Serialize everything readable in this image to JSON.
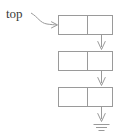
{
  "diagram": {
    "title": "top",
    "type": "linked-list-stack",
    "pointer_label": {
      "text": "top",
      "x": 6,
      "y": 16
    },
    "colors": {
      "stroke": "#9a9a9a",
      "box_fill": "#ffffff",
      "text": "#3a3a3a",
      "background": "#ffffff"
    },
    "geometry": {
      "box_left": 58,
      "box_right": 113,
      "box_width": 55,
      "box_height": 20,
      "divider_offset": 29,
      "link_x": 101.5
    },
    "nodes": [
      {
        "id": "node-1",
        "index": 0,
        "data_cell_label": "",
        "next_cell_label": "",
        "y": 15
      },
      {
        "id": "node-2",
        "index": 1,
        "data_cell_label": "",
        "next_cell_label": "",
        "y": 51
      },
      {
        "id": "node-3",
        "index": 2,
        "data_cell_label": "",
        "next_cell_label": "",
        "y": 87
      }
    ],
    "links": [
      {
        "id": "link-1",
        "from": "node-1",
        "to": "node-2",
        "x": 101.5,
        "y1": 25,
        "y2": 50
      },
      {
        "id": "link-2",
        "from": "node-2",
        "to": "node-3",
        "x": 101.5,
        "y1": 61,
        "y2": 86
      },
      {
        "id": "link-3",
        "from": "node-3",
        "to": "ground-symbol",
        "x": 101.5,
        "y1": 97,
        "y2": 121
      }
    ],
    "ground_symbol": {
      "id": "ground-symbol",
      "label": "null",
      "x": 101.5,
      "y": 124,
      "bars": [
        {
          "half_width": 8,
          "y": 124
        },
        {
          "half_width": 5.5,
          "y": 127
        },
        {
          "half_width": 3,
          "y": 130
        }
      ]
    },
    "top_pointer_path": {
      "description": "curved arrow from top label to first node left edge",
      "arrow_tip_x": 58,
      "arrow_tip_y": 25
    }
  }
}
